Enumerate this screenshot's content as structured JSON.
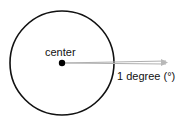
{
  "diagram": {
    "center_label": "center",
    "angle_label": "1 degree (°)",
    "colors": {
      "circle": "#111111",
      "ray": "#b0b0b0",
      "dot": "#000000"
    }
  }
}
